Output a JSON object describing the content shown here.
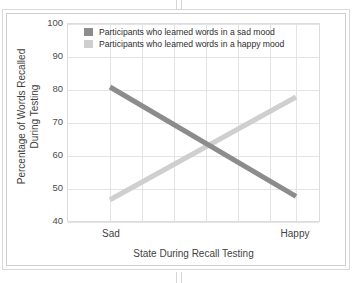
{
  "chart_data": {
    "type": "line",
    "title": "",
    "xlabel": "State During Recall Testing",
    "ylabel": "Percentage of Words Recalled During Testing",
    "ylabel_line1": "Percentage of Words Recalled",
    "ylabel_line2": "During Testing",
    "categories": [
      "Sad",
      "Happy"
    ],
    "xticklabels": [
      "Sad",
      "Happy"
    ],
    "yticklabels": [
      "40",
      "50",
      "60",
      "70",
      "80",
      "90",
      "100"
    ],
    "yticks": [
      40,
      50,
      60,
      70,
      80,
      90,
      100
    ],
    "ylim": [
      40,
      100
    ],
    "grid": true,
    "legend_position": "top-left-inside",
    "series": [
      {
        "name": "Participants who learned words in a sad mood",
        "values": [
          81,
          48
        ],
        "color": "#8c8c8c"
      },
      {
        "name": "Participants who learned words in a happy mood",
        "values": [
          47,
          78
        ],
        "color": "#cfcfcf"
      }
    ],
    "vertical_gridlines": 7,
    "colors": {
      "sad_mood_line": "#8c8c8c",
      "happy_mood_line": "#cfcfcf",
      "gridline": "#e4e4e4",
      "axis_text": "#3f3f3f",
      "frame": "#d8d8d8",
      "background": "#ffffff"
    }
  },
  "legend": {
    "items": [
      {
        "label": "Participants who learned words in a sad mood",
        "color": "#8c8c8c"
      },
      {
        "label": "Participants who learned words in a happy mood",
        "color": "#cfcfcf"
      }
    ]
  },
  "axes": {
    "x_title": "State During Recall Testing",
    "y_title_line1": "Percentage of Words Recalled",
    "y_title_line2": "During Testing",
    "y_labels": [
      "100",
      "90",
      "80",
      "70",
      "60",
      "50",
      "40"
    ],
    "x_labels": [
      "Sad",
      "Happy"
    ]
  }
}
